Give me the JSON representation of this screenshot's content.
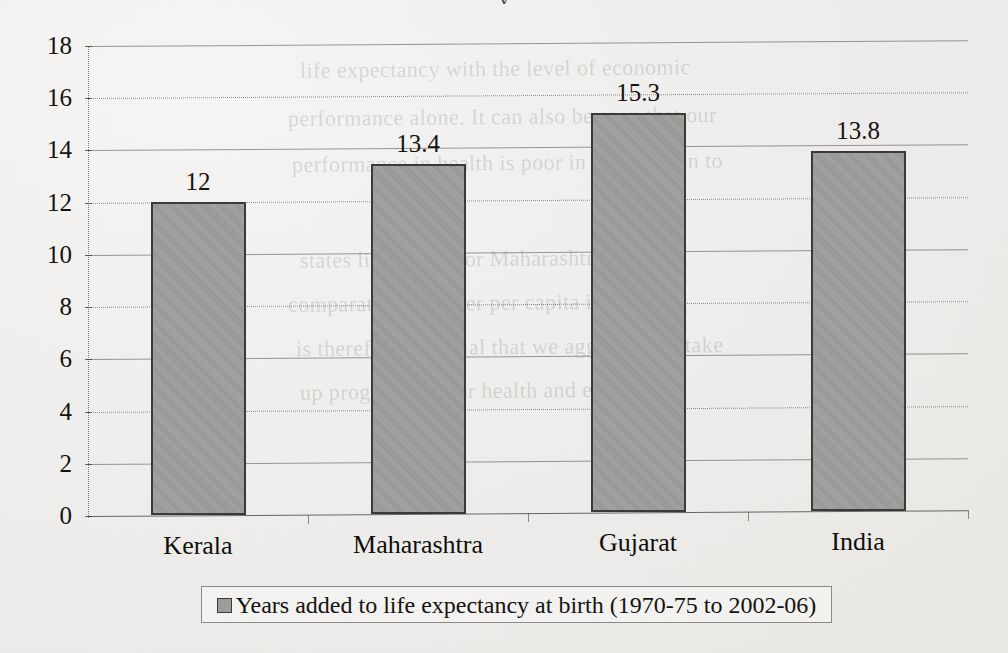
{
  "chart_data": {
    "type": "bar",
    "title": "",
    "categories": [
      "Kerala",
      "Maharashtra",
      "Gujarat",
      "India"
    ],
    "values": [
      12,
      13.4,
      15.3,
      13.8
    ],
    "value_labels": [
      "12",
      "13.4",
      "15.3",
      "13.8"
    ],
    "series": [
      {
        "name": "Years added to life expectancy at birth (1970-75 to 2002-06)",
        "values": [
          12,
          13.4,
          15.3,
          13.8
        ]
      }
    ],
    "xlabel": "",
    "ylabel": "",
    "ylim": [
      0,
      18
    ],
    "ytick_step": 2,
    "yticks": [
      "0",
      "2",
      "4",
      "6",
      "8",
      "10",
      "12",
      "14",
      "16",
      "18"
    ],
    "grid": true,
    "grid_style": "alternating solid and dotted horizontal gridlines",
    "legend": {
      "position": "bottom",
      "entries": [
        {
          "label": "Years added to life expectancy at birth (1970-75 to 2002-06)",
          "swatch_color": "#9d9d9b",
          "swatch_border": "#3b3a37"
        }
      ]
    },
    "colors": {
      "bar_fill": "#9d9d9b",
      "bar_border": "#3b3a37",
      "gridline": "#46443f",
      "text": "#15130f",
      "page_background": "#efeeec"
    }
  },
  "page": {
    "top_cropped_text": "y",
    "showthrough_lines": [
      "life expectancy with the level of economic",
      "performance alone. It can also be seen that our",
      "performance in health is poor in comparison to",
      "states like Kerala or Maharashtra, despite",
      "comparatively higher per capita income. It",
      "is therefore essential that we aggressively take",
      "up programmes for health and education"
    ]
  }
}
